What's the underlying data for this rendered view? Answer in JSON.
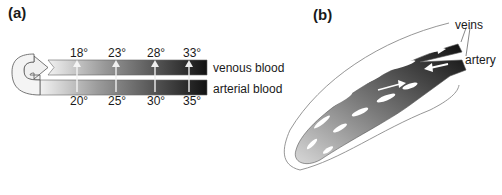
{
  "panel_a": {
    "label": "(a)",
    "venous_label": "venous blood",
    "arterial_label": "arterial blood",
    "venous_temps": [
      "18°",
      "23°",
      "28°",
      "33°"
    ],
    "arterial_temps": [
      "20°",
      "25°",
      "30°",
      "35°"
    ]
  },
  "panel_b": {
    "label": "(b)",
    "veins_label": "veins",
    "artery_label": "artery"
  },
  "colors": {
    "light": "#e8e8e8",
    "dark": "#141414",
    "outline": "#8a8a8a"
  }
}
